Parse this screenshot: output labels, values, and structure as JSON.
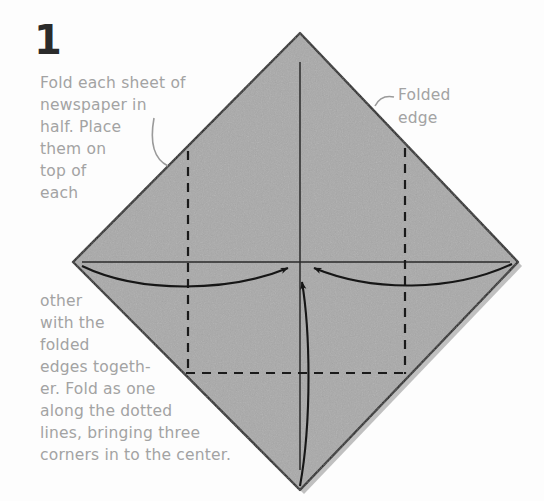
{
  "page": {
    "background": "#fdfdfd",
    "text_color": "#a3a3a3",
    "number_color": "#2b2b2b",
    "paper_fill": "#a9a9a9",
    "line_color": "#1a1a1a"
  },
  "step": {
    "number": "1"
  },
  "captions": {
    "top": "Fold each sheet of\nnewspaper in\nhalf. Place\nthem on\ntop of\neach",
    "bottom": "other\nwith the\nfolded\nedges togeth-\ner. Fold as one\nalong the dotted\nlines, bringing three\ncorners in to the center.",
    "full_instruction": "Fold each sheet of newspaper in half. Place them on top of each other with the folded edges together. Fold as one along the dotted lines, bringing three corners in to the center."
  },
  "labels": {
    "folded_edge": "Folded\nedge"
  },
  "diagram": {
    "shape": "diamond",
    "apex_top": [
      300,
      33
    ],
    "apex_bottom": [
      300,
      490
    ],
    "corner_left": [
      73,
      262
    ],
    "corner_right": [
      518,
      262
    ],
    "dashed_fold_left_x": 188,
    "dashed_fold_right_x": 405,
    "dashed_fold_bottom_y": 373,
    "center": [
      300,
      264
    ],
    "arrow_count": 3,
    "arrow_directions": [
      "from-left",
      "from-right",
      "from-bottom"
    ]
  }
}
